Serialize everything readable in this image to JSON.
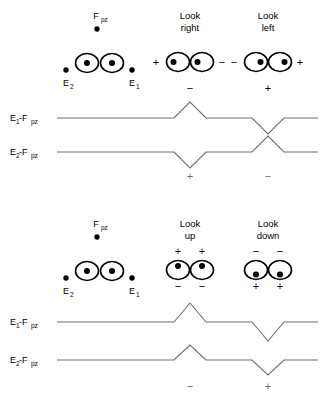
{
  "figure": {
    "trace_color": "#6e6e6e",
    "ink_color": "#000000",
    "background": "#ffffff"
  },
  "panels": [
    {
      "id": "horizontal",
      "name": "horizontal-eye-movements",
      "electrode_map": {
        "reference_label": "F",
        "reference_sub": "pz",
        "left_label": "E",
        "left_sub": "2",
        "right_label": "E",
        "right_sub": "1",
        "gaze": "center"
      },
      "conditions": [
        {
          "name": "look-right",
          "title_line1": "Look",
          "title_line2": "right",
          "gaze": "left",
          "polarity_left": "+",
          "polarity_right": "−",
          "polarity_position": "horizontal",
          "top_sign": "−",
          "bottom_sign": "+"
        },
        {
          "name": "look-left",
          "title_line1": "Look",
          "title_line2": "left",
          "gaze": "right",
          "polarity_left": "−",
          "polarity_right": "+",
          "polarity_position": "horizontal",
          "top_sign": "+",
          "bottom_sign": "−"
        }
      ],
      "channels": [
        {
          "name": "channel-e1-fpz",
          "label_main": "E",
          "label_sub": "1",
          "label_sep": "-F",
          "label_sub2": "pz",
          "deflections": [
            {
              "condition": "look-right",
              "direction": "up"
            },
            {
              "condition": "look-left",
              "direction": "down"
            }
          ]
        },
        {
          "name": "channel-e2-fpz",
          "label_main": "E",
          "label_sub": "2",
          "label_sep": "-F",
          "label_sub2": "pz",
          "deflections": [
            {
              "condition": "look-right",
              "direction": "down"
            },
            {
              "condition": "look-left",
              "direction": "up"
            }
          ]
        }
      ]
    },
    {
      "id": "vertical",
      "name": "vertical-eye-movements",
      "electrode_map": {
        "reference_label": "F",
        "reference_sub": "pz",
        "left_label": "E",
        "left_sub": "2",
        "right_label": "E",
        "right_sub": "1",
        "gaze": "center"
      },
      "conditions": [
        {
          "name": "look-up",
          "title_line1": "Look",
          "title_line2": "up",
          "gaze": "up",
          "polarity_top": "+",
          "polarity_bottom": "−",
          "polarity_position": "vertical",
          "bottom_sign": "−"
        },
        {
          "name": "look-down",
          "title_line1": "Look",
          "title_line2": "down",
          "gaze": "down",
          "polarity_top": "−",
          "polarity_bottom": "+",
          "polarity_position": "vertical",
          "bottom_sign": "+"
        }
      ],
      "channels": [
        {
          "name": "channel-e1-fpz",
          "label_main": "E",
          "label_sub": "1",
          "label_sep": "-F",
          "label_sub2": "pz",
          "deflections": [
            {
              "condition": "look-up",
              "direction": "up"
            },
            {
              "condition": "look-down",
              "direction": "down"
            }
          ]
        },
        {
          "name": "channel-e2-fpz",
          "label_main": "E",
          "label_sub": "2",
          "label_sep": "-F",
          "label_sub2": "pz",
          "deflections": [
            {
              "condition": "look-up",
              "direction": "up"
            },
            {
              "condition": "look-down",
              "direction": "down"
            }
          ]
        }
      ]
    }
  ],
  "text": {
    "look": "Look",
    "right": "right",
    "left": "left",
    "up": "up",
    "down": "down",
    "plus": "+",
    "minus": "−",
    "E": "E",
    "F": "F",
    "one": "1",
    "two": "2",
    "pz": "pz",
    "sepF": "-F",
    "p_top_hr": "−",
    "p_bot_hr": "+",
    "p_top_hl": "+",
    "p_bot_hl": "−",
    "p_bot_vu": "−",
    "p_bot_vd": "+"
  }
}
